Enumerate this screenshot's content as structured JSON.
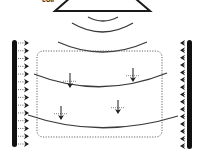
{
  "diagram": {
    "top_label": "coil",
    "colors": {
      "line": "#1a1a1a",
      "curve": "#3a3a3a",
      "dotted": "#666666",
      "electrode": "#111111"
    },
    "source_triangle": {
      "base_y": 11,
      "x1": 55,
      "x2": 150,
      "apex_x": 102,
      "apex_y": -30
    },
    "waves": [
      {
        "x1": 88,
        "x2": 118,
        "y_end": 17,
        "y_mid": 21
      },
      {
        "x1": 72,
        "x2": 133,
        "y_end": 23,
        "y_mid": 32
      },
      {
        "x1": 58,
        "x2": 147,
        "y_end": 42,
        "y_mid": 52
      }
    ],
    "electrodes": {
      "left": {
        "x": 12,
        "y1": 40,
        "y2": 147,
        "arrow_count": 14,
        "arrow_x": 29
      },
      "right": {
        "x": 187,
        "y1": 40,
        "y2": 149,
        "arrow_count": 15,
        "arrow_x": 180
      }
    },
    "field_region": {
      "x": 37,
      "y": 51,
      "w": 125,
      "h": 86,
      "radius": 6
    },
    "field_lines": [
      {
        "x1": 34,
        "y1": 74,
        "cx": 100,
        "cy": 100,
        "x2": 167,
        "y2": 73
      },
      {
        "x1": 28,
        "y1": 115,
        "cx": 100,
        "cy": 140,
        "x2": 178,
        "y2": 116
      }
    ],
    "force_arrows": [
      {
        "x": 70,
        "y1": 73,
        "y2": 88
      },
      {
        "x": 133,
        "y1": 68,
        "y2": 82
      },
      {
        "x": 118,
        "y1": 100,
        "y2": 114
      },
      {
        "x": 61,
        "y1": 106,
        "y2": 120
      }
    ]
  }
}
